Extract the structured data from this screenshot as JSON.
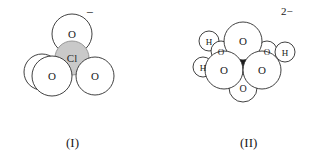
{
  "figure": {
    "background_color": "#ffffff",
    "line_color": "#2b2b2b",
    "sphere_fill": "#ffffff",
    "central_atom_fill_i": "#c9c9c9",
    "central_atom_fill_ii": "#1c1c1c",
    "label_color": "#1a1a1a"
  },
  "structures": [
    {
      "id": "structure-i",
      "caption": "(I)",
      "charge": "−",
      "central_atom": "Cl",
      "atoms": [
        {
          "label": "O",
          "role": "top-oxygen"
        },
        {
          "label": "Cl",
          "role": "central-chlorine"
        },
        {
          "label": "O",
          "role": "back-left-oxygen"
        },
        {
          "label": "O",
          "role": "front-left-oxygen"
        },
        {
          "label": "O",
          "role": "front-right-oxygen"
        }
      ]
    },
    {
      "id": "structure-ii",
      "caption": "(II)",
      "charge": "2−",
      "central_atom": "",
      "atoms": [
        {
          "label": "O",
          "role": "top-oxygen"
        },
        {
          "label": "O",
          "role": "front-left-oxygen"
        },
        {
          "label": "O",
          "role": "front-right-oxygen"
        },
        {
          "label": "O",
          "role": "bottom-oxygen"
        },
        {
          "label": "O",
          "role": "upper-left-hydroxyl-oxygen"
        },
        {
          "label": "H",
          "role": "upper-left-hydrogen"
        },
        {
          "label": "O",
          "role": "upper-right-hydroxyl-oxygen"
        },
        {
          "label": "H",
          "role": "upper-right-hydrogen"
        },
        {
          "label": "H",
          "role": "lower-left-hydrogen"
        }
      ]
    }
  ]
}
